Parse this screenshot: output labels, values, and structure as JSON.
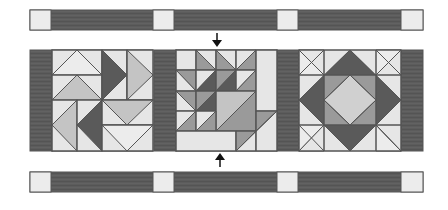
{
  "diagram": {
    "colors": {
      "background": "#ffffff",
      "dark": "#5a5a5a",
      "medium": "#9a9a9a",
      "light_medium": "#c4c4c4",
      "light": "#e6e6e6",
      "outline": "#555555",
      "arrow": "#111111"
    },
    "sashing_strips": [
      {
        "name": "top-sashing-strip",
        "y": 10,
        "height": 20
      },
      {
        "name": "bottom-sashing-strip",
        "y": 172,
        "height": 20
      }
    ],
    "sashing_segments": {
      "cornerstones_x": [
        30,
        153,
        277,
        401
      ],
      "cornerstone_width": 22,
      "strip_end_x": 423
    },
    "block_row": {
      "y": 50,
      "height": 101,
      "spacer_strips_x": [
        30,
        154,
        277,
        401
      ],
      "spacer_width": 22,
      "blocks": [
        {
          "name": "pinwheel-flying-geese-block",
          "x": 52,
          "width": 102
        },
        {
          "name": "basket-block",
          "x": 176,
          "width": 101
        },
        {
          "name": "square-in-square-block",
          "x": 299,
          "width": 102
        }
      ]
    },
    "arrows": [
      {
        "name": "down-arrow",
        "direction": "down",
        "x": 217,
        "y1": 32,
        "y2": 46
      },
      {
        "name": "up-arrow",
        "direction": "up",
        "x": 220,
        "y1": 168,
        "y2": 154
      }
    ]
  }
}
